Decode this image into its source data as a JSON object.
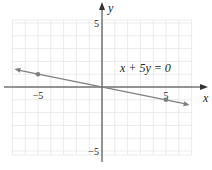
{
  "chart_data": {
    "type": "line",
    "title": "",
    "xlabel": "x",
    "ylabel": "y",
    "xlim": [
      -7,
      7
    ],
    "ylim": [
      -5,
      5
    ],
    "grid": true,
    "x_ticks": [
      {
        "value": -5,
        "label": "−5"
      },
      {
        "value": 5,
        "label": "5"
      }
    ],
    "y_ticks": [
      {
        "value": 5,
        "label": "5"
      },
      {
        "value": -5,
        "label": "−5"
      }
    ],
    "series": [
      {
        "name": "x + 5y = 0",
        "equation": "x + 5y = 0",
        "color": "#808080",
        "line_x_range": [
          -7,
          7
        ],
        "points": [
          {
            "x": -5,
            "y": 1
          },
          {
            "x": 5,
            "y": -1
          }
        ]
      }
    ],
    "annotations": [
      {
        "text": "x + 5y = 0",
        "x": 4.3,
        "y": 2
      }
    ]
  }
}
